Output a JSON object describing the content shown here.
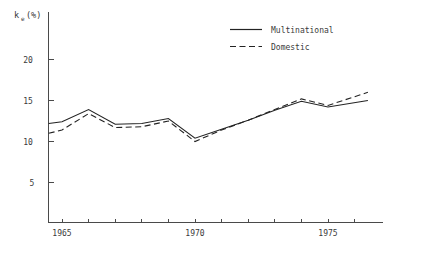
{
  "chart_data": {
    "type": "line",
    "title": "",
    "xlabel": "",
    "ylabel": "k_e (%)",
    "ylabel_main": "k",
    "ylabel_subscript": "e",
    "ylabel_unit": "(%)",
    "xlim": [
      1964.5,
      1977.0
    ],
    "ylim": [
      0,
      22.5
    ],
    "grid": false,
    "legend_position": "top-right",
    "y_ticks": [
      5,
      10,
      15,
      20
    ],
    "y_tick_labels": [
      "5",
      "10",
      "15",
      "20"
    ],
    "x_ticks": [
      1965,
      1966,
      1967,
      1968,
      1969,
      1970,
      1971,
      1972,
      1973,
      1974,
      1975,
      1976
    ],
    "x_tick_labels_shown": [
      "1965",
      "1970",
      "1975"
    ],
    "x_labeled_ticks": [
      1965,
      1970,
      1975
    ],
    "x": [
      1964.5,
      1965,
      1966,
      1967,
      1968,
      1969,
      1970,
      1971,
      1972,
      1973,
      1974,
      1975,
      1976.5
    ],
    "series": [
      {
        "name": "Multinational",
        "style": "solid",
        "values": [
          12.2,
          12.4,
          13.9,
          12.1,
          12.2,
          12.8,
          10.4,
          11.5,
          12.6,
          13.8,
          14.9,
          14.2,
          15.0
        ]
      },
      {
        "name": "Domestic",
        "style": "dashed",
        "values": [
          11.0,
          11.4,
          13.4,
          11.7,
          11.8,
          12.5,
          10.0,
          11.4,
          12.6,
          13.9,
          15.2,
          14.4,
          16.0
        ]
      }
    ]
  },
  "legend": {
    "items": [
      {
        "label": "Multinational",
        "style": "solid"
      },
      {
        "label": "Domestic",
        "style": "dashed"
      }
    ]
  }
}
